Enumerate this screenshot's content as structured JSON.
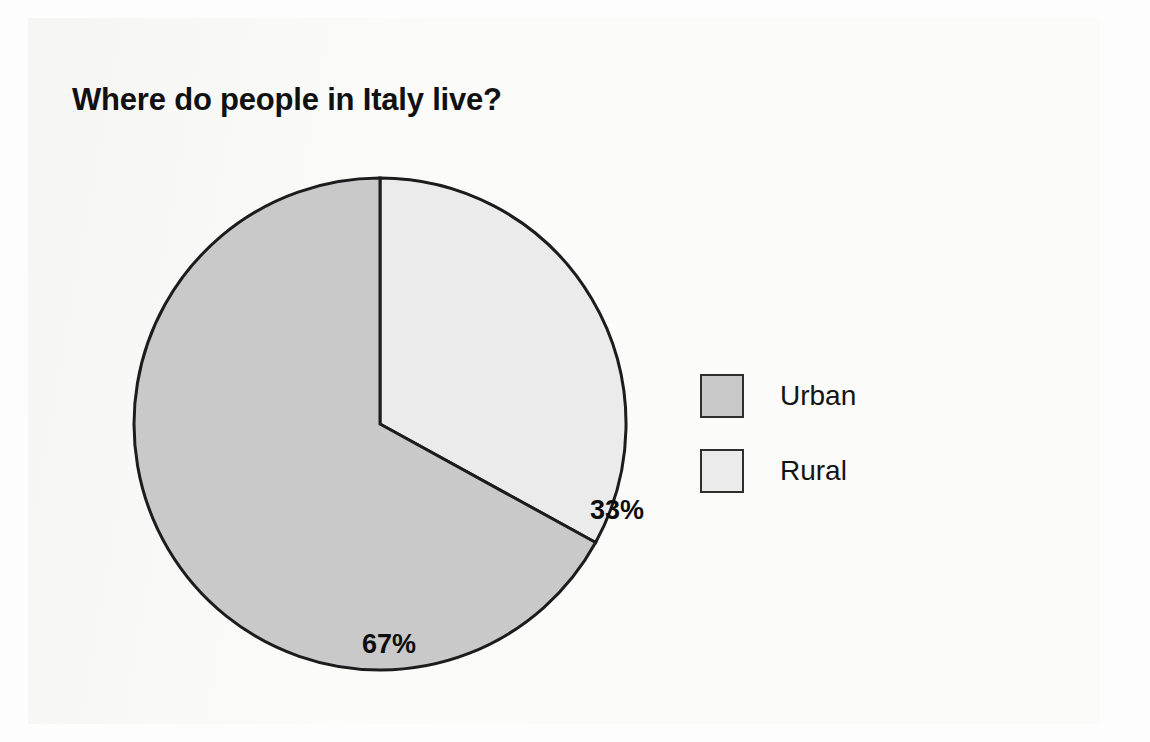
{
  "page": {
    "background_color": "#fbfbfa"
  },
  "chart_data": {
    "type": "pie",
    "title": "Where do people in Italy live?",
    "xlabel": "",
    "ylabel": "",
    "categories": [
      "Urban",
      "Rural"
    ],
    "values": [
      67,
      33
    ],
    "value_labels": [
      "67%",
      "33%"
    ],
    "units": "percent",
    "legend_position": "right",
    "grid": false,
    "start_angle_deg": 0,
    "direction": "urban-counterclockwise-from-12-oclock",
    "slices": [
      {
        "name": "Urban",
        "value": 67,
        "label": "67%",
        "color": "#c9c9c9",
        "border_color": "#1c1c1c"
      },
      {
        "name": "Rural",
        "value": 33,
        "label": "33%",
        "color": "#ebebeb",
        "border_color": "#1c1c1c"
      }
    ]
  },
  "legend": {
    "items": [
      {
        "label": "Urban",
        "color": "#c9c9c9"
      },
      {
        "label": "Rural",
        "color": "#ebebeb"
      }
    ]
  },
  "colors": {
    "urban": "#c9c9c9",
    "rural": "#ebebeb",
    "outline": "#1c1c1c",
    "text": "#111111"
  }
}
